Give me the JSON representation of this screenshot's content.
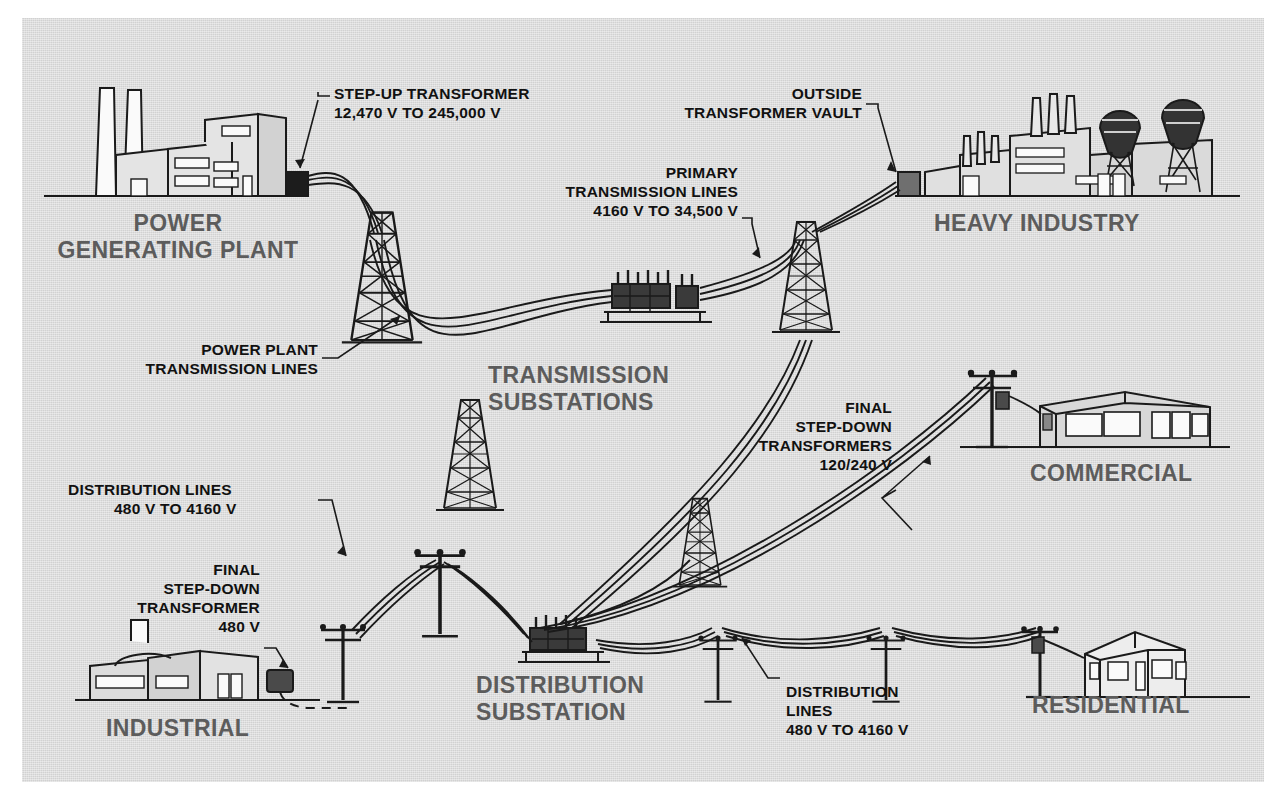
{
  "diagram": {
    "background_color": "#dcdcdc",
    "site_label_color": "#5c5c5c",
    "callout_color": "#111111"
  },
  "sites": [
    {
      "id": "power-plant",
      "label": "POWER\nGENERATING PLANT"
    },
    {
      "id": "heavy-industry",
      "label": "HEAVY INDUSTRY"
    },
    {
      "id": "transmission-substations",
      "label": "TRANSMISSION\nSUBSTATIONS"
    },
    {
      "id": "commercial",
      "label": "COMMERCIAL"
    },
    {
      "id": "distribution-substation",
      "label": "DISTRIBUTION\nSUBSTATION"
    },
    {
      "id": "residential",
      "label": "RESIDENTIAL"
    },
    {
      "id": "industrial",
      "label": "INDUSTRIAL"
    }
  ],
  "callouts": [
    {
      "id": "step-up-transformer",
      "line1": "STEP-UP TRANSFORMER",
      "line2": "12,470 V TO 245,000 V"
    },
    {
      "id": "outside-transformer-vault",
      "line1": "OUTSIDE",
      "line2": "TRANSFORMER VAULT"
    },
    {
      "id": "primary-transmission-lines",
      "line1": "PRIMARY",
      "line2": "TRANSMISSION LINES",
      "line3": "4160 V TO 34,500 V"
    },
    {
      "id": "power-plant-transmission-lines",
      "line1": "POWER PLANT",
      "line2": "TRANSMISSION LINES"
    },
    {
      "id": "final-step-down-transformers-commercial",
      "line1": "FINAL",
      "line2": "STEP-DOWN",
      "line3": "TRANSFORMERS",
      "line4": "120/240 V"
    },
    {
      "id": "distribution-lines-left",
      "line1": "DISTRIBUTION LINES",
      "line2": "480 V TO 4160 V"
    },
    {
      "id": "final-step-down-transformer-industrial",
      "line1": "FINAL",
      "line2": "STEP-DOWN",
      "line3": "TRANSFORMER",
      "line4": "480 V"
    },
    {
      "id": "distribution-lines-right",
      "line1": "DISTRIBUTION",
      "line2": "LINES",
      "line3": "480 V TO 4160 V"
    }
  ],
  "voltages": {
    "generation": "12,470 V",
    "transmission_high": "245,000 V",
    "primary_transmission_low": "4160 V",
    "primary_transmission_high": "34,500 V",
    "distribution_low": "480 V",
    "distribution_high": "4160 V",
    "service_industrial": "480 V",
    "service_residential": "120/240 V"
  }
}
